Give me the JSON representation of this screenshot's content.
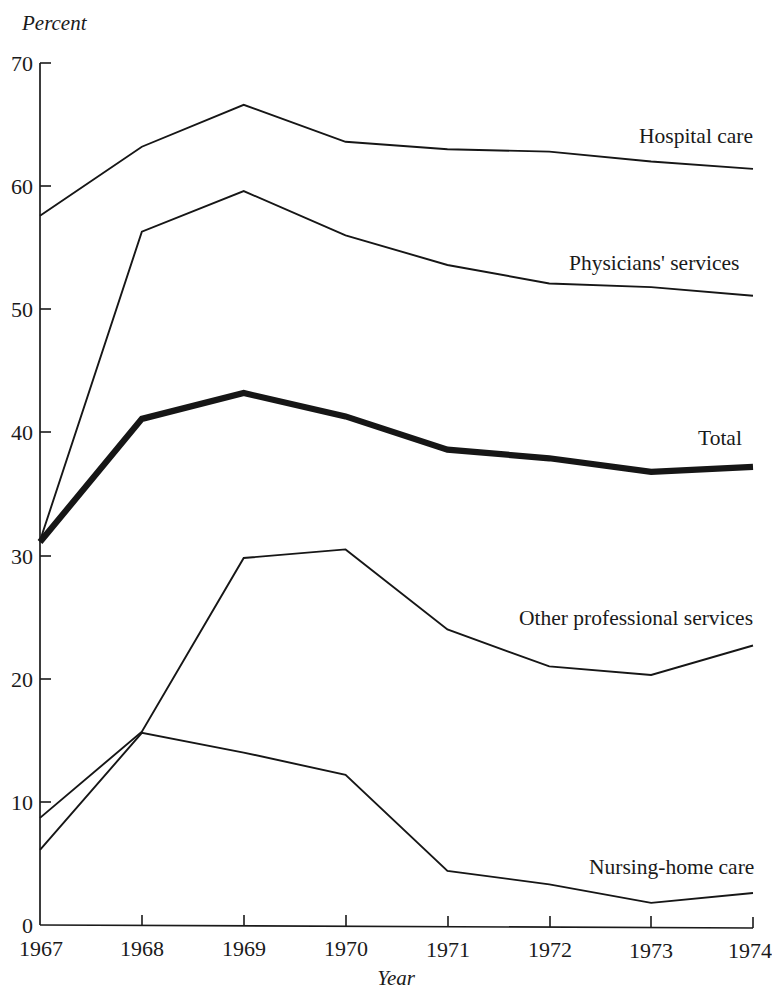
{
  "chart_data": {
    "type": "line",
    "title": "",
    "xlabel": "Year",
    "ylabel": "Percent",
    "x": [
      1967,
      1968,
      1969,
      1970,
      1971,
      1972,
      1973,
      1974
    ],
    "xtick_labels": [
      "1967",
      "1968",
      "1969",
      "1970",
      "1971",
      "1972",
      "1973",
      "1974"
    ],
    "ytick_labels": [
      "0",
      "10",
      "20",
      "30",
      "40",
      "50",
      "60",
      "70"
    ],
    "yticks": [
      0,
      10,
      20,
      30,
      40,
      50,
      60,
      70
    ],
    "ylim": [
      0,
      70
    ],
    "xlim": [
      1967,
      1974
    ],
    "grid": false,
    "legend_position": "inline-right-of-line-ends",
    "series": [
      {
        "name": "Hospital care",
        "label": "Hospital care",
        "emphasis": "normal",
        "values": [
          57.6,
          63.2,
          66.6,
          63.6,
          63.0,
          62.8,
          62.0,
          61.4
        ]
      },
      {
        "name": "Physicians' services",
        "label": "Physicians' services",
        "emphasis": "normal",
        "values": [
          31.2,
          56.3,
          59.6,
          56.0,
          53.6,
          52.1,
          51.8,
          51.1
        ]
      },
      {
        "name": "Total",
        "label": "Total",
        "emphasis": "bold",
        "values": [
          31.1,
          41.1,
          43.2,
          41.3,
          38.6,
          37.9,
          36.8,
          37.2
        ]
      },
      {
        "name": "Other professional services",
        "label": "Other professional services",
        "emphasis": "normal",
        "values": [
          8.7,
          15.7,
          29.8,
          30.5,
          24.0,
          21.0,
          20.3,
          22.7
        ]
      },
      {
        "name": "Nursing-home care",
        "label": "Nursing-home care",
        "emphasis": "normal",
        "values": [
          6.1,
          15.6,
          14.0,
          12.2,
          4.4,
          3.3,
          1.8,
          2.6
        ]
      }
    ],
    "series_labels": {
      "hospital_care": "Hospital care",
      "physicians_services": "Physicians' services",
      "total": "Total",
      "other_professional_services": "Other professional services",
      "nursing_home_care": "Nursing-home care"
    },
    "colors": {
      "line": "#161616",
      "axis": "#1a1a1a",
      "background": "#ffffff"
    }
  }
}
